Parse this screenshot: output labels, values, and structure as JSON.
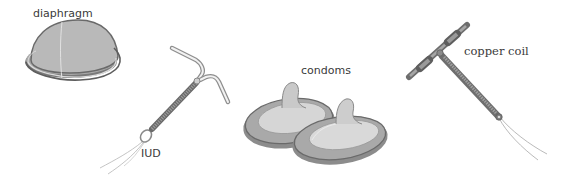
{
  "figure": {
    "title": "",
    "items": [
      {
        "id": "diaphragm",
        "label": "diaphragm"
      },
      {
        "id": "iud",
        "label": "IUD"
      },
      {
        "id": "condoms",
        "label": "condoms"
      },
      {
        "id": "copper-coil",
        "label": "copper coil"
      }
    ]
  },
  "colors": {
    "background": "#ffffff",
    "device_fill": "#bdbdbd",
    "device_dark": "#6e6e6e",
    "device_light": "#dcdcdc",
    "thread": "#9a9a9a",
    "label_text": "#3a3a3a"
  }
}
